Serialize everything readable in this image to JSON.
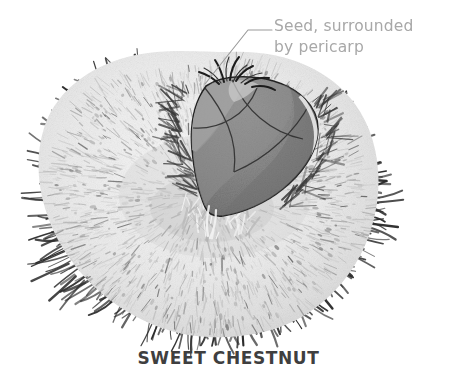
{
  "figure": {
    "title": "SWEET CHESTNUT",
    "annotations": [
      {
        "name": "seed-annotation",
        "line1": "Seed, surrounded",
        "line2": "by pericarp",
        "text_color": "#a8a8a8",
        "leader_color": "#9a9a9a"
      }
    ],
    "caption_color": "#3f3f3f",
    "parts": {
      "husk": {
        "label": "spiny burr husk",
        "body_color": "#eeeeee",
        "spine_color": "#2c2c2c",
        "fleck_color": "#8d8d8d"
      },
      "seed": {
        "label": "chestnut seed with pericarp",
        "fill_color": "#8a8a8a",
        "highlight_color": "#9d9d9d",
        "shadow_color": "#6f6f6f",
        "outline_color": "#1f1f1f"
      }
    },
    "background_color": "#ffffff"
  }
}
